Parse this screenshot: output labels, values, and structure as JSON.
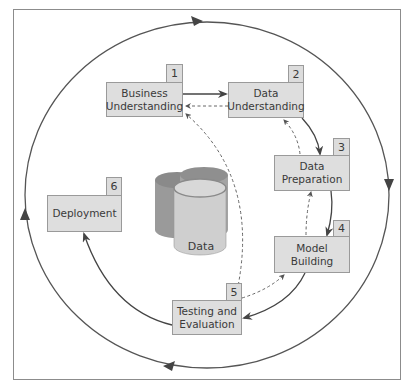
{
  "diagram": {
    "title": "",
    "center_store": {
      "label": "Data",
      "icon": "database-cylinders-icon"
    },
    "steps": [
      {
        "number": "1",
        "label": "Business\nUnderstanding"
      },
      {
        "number": "2",
        "label": "Data\nUnderstanding"
      },
      {
        "number": "3",
        "label": "Data\nPreparation"
      },
      {
        "number": "4",
        "label": "Model\nBuilding"
      },
      {
        "number": "5",
        "label": "Testing and\nEvaluation"
      },
      {
        "number": "6",
        "label": "Deployment"
      }
    ],
    "flows": [
      {
        "from": "1",
        "to": "2",
        "style": "solid"
      },
      {
        "from": "2",
        "to": "3",
        "style": "solid"
      },
      {
        "from": "3",
        "to": "4",
        "style": "solid"
      },
      {
        "from": "4",
        "to": "5",
        "style": "solid"
      },
      {
        "from": "5",
        "to": "6",
        "style": "solid"
      },
      {
        "from": "2",
        "to": "1",
        "style": "dashed"
      },
      {
        "from": "3",
        "to": "2",
        "style": "dashed"
      },
      {
        "from": "4",
        "to": "3",
        "style": "dashed"
      },
      {
        "from": "5",
        "to": "4",
        "style": "dashed"
      },
      {
        "from": "5",
        "to": "1",
        "style": "dashed"
      }
    ],
    "outer_cycle": {
      "direction": "clockwise"
    },
    "colors": {
      "box_fill": "#dedede",
      "box_border": "#9a9a9a",
      "line": "#444444",
      "cylinder_dark": "#9d9d9d",
      "cylinder_light": "#d0d0d0"
    }
  }
}
